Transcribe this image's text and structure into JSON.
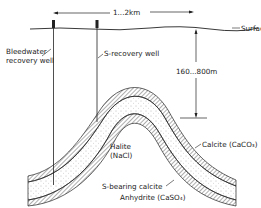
{
  "diagram": {
    "type": "geological cross-section",
    "labels": {
      "distance": "1...2km",
      "surface": "Surface",
      "depth": "160...800m",
      "bleedwater_well_line1": "Bleedwater",
      "bleedwater_well_line2": "recovery well",
      "s_recovery_well": "S-recovery well",
      "halite_line1": "Halite",
      "halite_line2": "(NaCl)",
      "calcite": "Calcite (CaCO₃)",
      "s_bearing_calcite": "S-bearing calcite",
      "anhydrite": "Anhydrite (CaSO₄)"
    },
    "colors": {
      "line": "#222222",
      "stipple": "#888888",
      "background": "#ffffff"
    }
  }
}
